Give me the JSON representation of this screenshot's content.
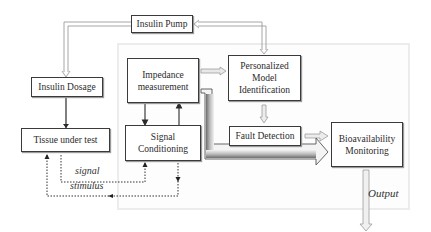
{
  "diagram": {
    "container": {
      "label": ""
    },
    "nodes": {
      "insulin_pump": {
        "label": "Insulin Pump"
      },
      "insulin_dosage": {
        "label": "Insulin Dosage"
      },
      "tissue_under_test": {
        "label": "Tissue under test"
      },
      "impedance_measurement": {
        "line1": "Impedance",
        "line2": "measurement"
      },
      "signal_conditioning": {
        "line1": "Signal",
        "line2": "Conditioning"
      },
      "personalized_model": {
        "line1": "Personalized",
        "line2": "Model",
        "line3": "Identification"
      },
      "fault_detection": {
        "label": "Fault Detection"
      },
      "bioavailability": {
        "line1": "Bioavailability",
        "line2": "Monitoring"
      }
    },
    "edge_labels": {
      "signal": "signal",
      "stimulus": "stimulus",
      "output": "Output"
    },
    "edges": [
      {
        "from": "Insulin Pump",
        "to": "Insulin Dosage",
        "style": "hollow-arrow"
      },
      {
        "from": "Personalized Model Identification",
        "to": "Insulin Pump",
        "style": "hollow-arrow"
      },
      {
        "from": "Insulin Dosage",
        "to": "Tissue under test",
        "style": "solid-line"
      },
      {
        "from": "Impedance measurement",
        "to": "Signal Conditioning",
        "style": "solid-arrow"
      },
      {
        "from": "Signal Conditioning",
        "to": "Impedance measurement",
        "style": "solid-arrow"
      },
      {
        "from": "Tissue under test",
        "to": "Signal Conditioning",
        "style": "dotted-arrow",
        "label": "signal"
      },
      {
        "from": "Signal Conditioning",
        "to": "Tissue under test",
        "style": "dotted-arrow",
        "label": "stimulus"
      },
      {
        "from": "Impedance measurement",
        "to": "Personalized Model Identification",
        "style": "hollow-arrow"
      },
      {
        "from": "Personalized Model Identification",
        "to": "Fault Detection",
        "style": "hollow-arrow"
      },
      {
        "from": "Fault Detection",
        "to": "Bioavailability Monitoring",
        "style": "hollow-arrow"
      },
      {
        "from": "Impedance measurement",
        "to": "Bioavailability Monitoring",
        "style": "thick-hollow-arrow"
      },
      {
        "from": "Bioavailability Monitoring",
        "to": "Output",
        "style": "hollow-arrow"
      }
    ]
  },
  "colors": {
    "box_border": "#3a3a3a",
    "arrow_hollow": "#9c9c9c",
    "container_border": "#ececec",
    "thick_arrow_fill_dark": "#7a7a7a"
  }
}
